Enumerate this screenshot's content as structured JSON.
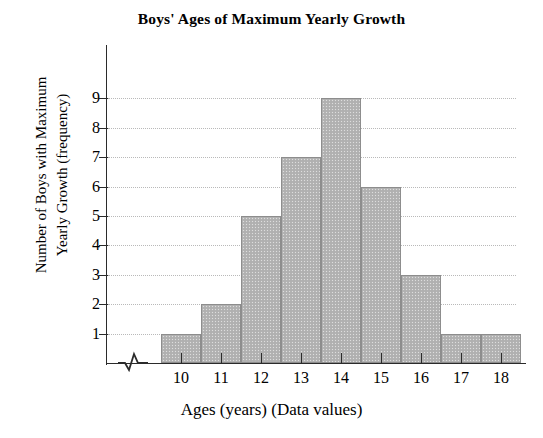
{
  "chart_data": {
    "type": "bar",
    "title": "Boys' Ages of Maximum Yearly Growth",
    "xlabel": "Ages (years) (Data values)",
    "ylabel_line1": "Number of Boys with Maximum",
    "ylabel_line2": "Yearly Growth (frequency)",
    "categories": [
      "10",
      "11",
      "12",
      "13",
      "14",
      "15",
      "16",
      "17",
      "18"
    ],
    "values": [
      1,
      2,
      5,
      7,
      9,
      6,
      3,
      1,
      1
    ],
    "x_tick_labels": [
      "10",
      "11",
      "12",
      "13",
      "14",
      "15",
      "16",
      "17",
      "18"
    ],
    "y_tick_labels": [
      "9",
      "8",
      "7",
      "6",
      "5",
      "4",
      "3",
      "2",
      "1"
    ],
    "ylim": [
      0,
      9.6
    ],
    "xlim": [
      9.5,
      18.5
    ],
    "grid": "horizontal-dotted",
    "legend": "none",
    "axis_break": "x-axis near origin",
    "bar_fill_color": "#b3b3b3",
    "bar_edge_color": "#8d8d8d",
    "grid_color": "#b9b9b9",
    "axis_color": "#2b2b2b",
    "background_color": "#ffffff"
  }
}
